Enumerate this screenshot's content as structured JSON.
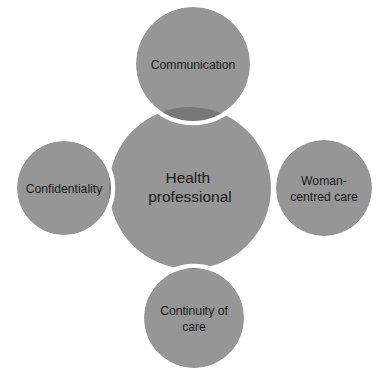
{
  "diagram": {
    "type": "venn-overlap-cluster",
    "title_visible": false,
    "background_color": "#ffffff",
    "colors": {
      "circle_fill": "#969696",
      "overlap_fill": "#787878",
      "ring_stroke": "#ffffff",
      "label_text": "#1c1c1c"
    },
    "center": {
      "name": "health-professional",
      "label_line1": "Health",
      "label_line2": "professional",
      "cx": 190,
      "cy": 188,
      "r": 81
    },
    "satellites": [
      {
        "name": "communication",
        "position": "top",
        "label_line1": "Communication",
        "label_line2": "",
        "cx": 193,
        "cy": 64,
        "r": 57
      },
      {
        "name": "woman-centred-care",
        "position": "right",
        "label_line1": "Woman-",
        "label_line2": "centred care",
        "cx": 324,
        "cy": 188,
        "r": 48
      },
      {
        "name": "continuity-of-care",
        "position": "bottom",
        "label_line1": "Continuity of",
        "label_line2": "care",
        "cx": 194,
        "cy": 318,
        "r": 50
      },
      {
        "name": "confidentiality",
        "position": "left",
        "label_line1": "Confidentiality",
        "label_line2": "",
        "cx": 64,
        "cy": 188,
        "r": 47
      }
    ]
  }
}
